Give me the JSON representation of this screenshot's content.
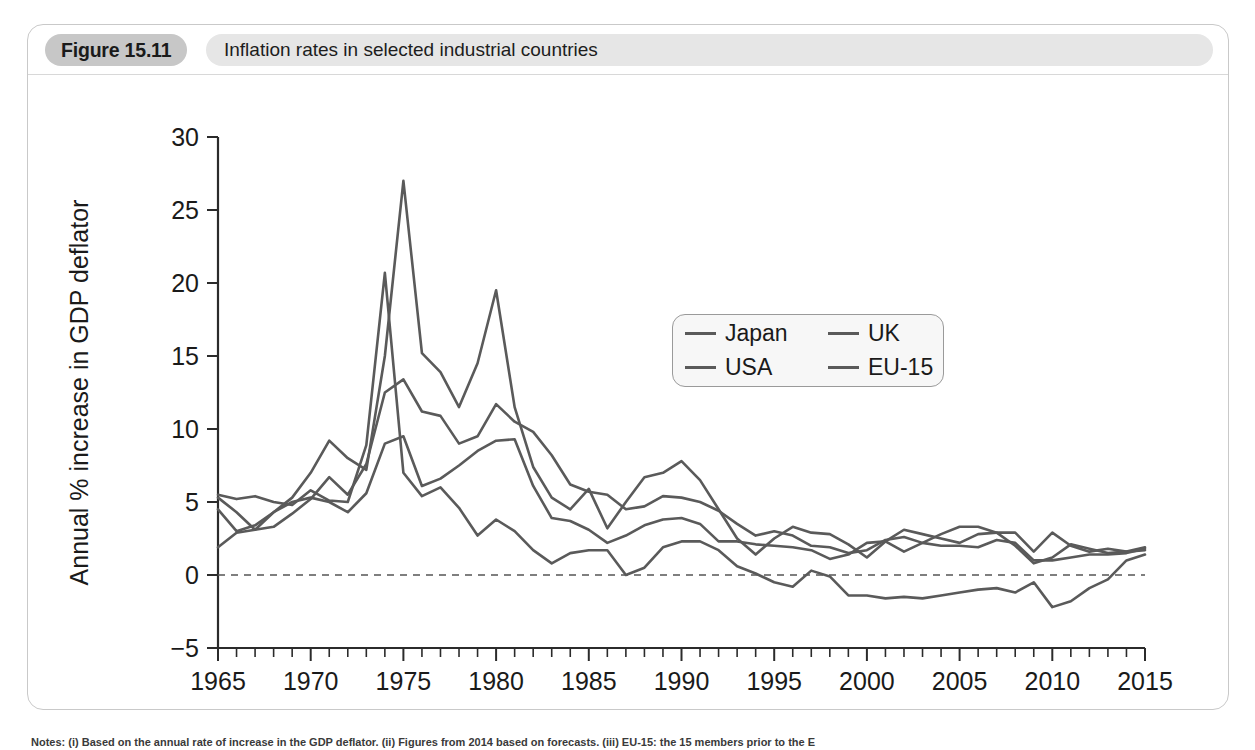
{
  "figure": {
    "number_label": "Figure 15.11",
    "title": "Inflation rates in selected industrial countries",
    "notes": "Notes: (i) Based on the annual rate of increase in the GDP deflator. (ii) Figures from 2014 based on forecasts. (iii) EU-15: the 15 members prior to the E"
  },
  "legend": {
    "items": [
      {
        "label": "Japan",
        "color": "#5a5a5a"
      },
      {
        "label": "UK",
        "color": "#5a5a5a"
      },
      {
        "label": "USA",
        "color": "#5a5a5a"
      },
      {
        "label": "EU-15",
        "color": "#5a5a5a"
      }
    ]
  },
  "chart_data": {
    "type": "line",
    "title": "Inflation rates in selected industrial countries",
    "xlabel": "",
    "ylabel": "Annual % increase in GDP deflator",
    "xlim": [
      1965,
      2015
    ],
    "ylim": [
      -5,
      30
    ],
    "ytick_labels": [
      "30",
      "25",
      "20",
      "15",
      "10",
      "5",
      "0",
      "-5"
    ],
    "yticks": [
      30,
      25,
      20,
      15,
      10,
      5,
      0,
      -5
    ],
    "xtick_labels": [
      "1965",
      "1970",
      "1975",
      "1980",
      "1985",
      "1990",
      "1995",
      "2000",
      "2005",
      "2010",
      "2015"
    ],
    "xticks": [
      1965,
      1970,
      1975,
      1980,
      1985,
      1990,
      1995,
      2000,
      2005,
      2010,
      2015
    ],
    "x_minor_step": 1,
    "grid": false,
    "zero_reference_line": 0,
    "legend_position": "upper-center-right",
    "x": [
      1965,
      1966,
      1967,
      1968,
      1969,
      1970,
      1971,
      1972,
      1973,
      1974,
      1975,
      1976,
      1977,
      1978,
      1979,
      1980,
      1981,
      1982,
      1983,
      1984,
      1985,
      1986,
      1987,
      1988,
      1989,
      1990,
      1991,
      1992,
      1993,
      1994,
      1995,
      1996,
      1997,
      1998,
      1999,
      2000,
      2001,
      2002,
      2003,
      2004,
      2005,
      2006,
      2007,
      2008,
      2009,
      2010,
      2011,
      2012,
      2013,
      2014,
      2015
    ],
    "series": [
      {
        "name": "Japan",
        "color": "#5a5a5a",
        "values": [
          5.5,
          5.2,
          5.4,
          5.0,
          4.8,
          5.8,
          5.1,
          5.0,
          8.9,
          20.7,
          7.0,
          5.4,
          6.0,
          4.6,
          2.7,
          3.8,
          3.0,
          1.7,
          0.8,
          1.5,
          1.7,
          1.7,
          0.0,
          0.5,
          1.9,
          2.3,
          2.3,
          1.7,
          0.6,
          0.1,
          -0.5,
          -0.8,
          0.3,
          -0.1,
          -1.4,
          -1.4,
          -1.6,
          -1.5,
          -1.6,
          -1.4,
          -1.2,
          -1.0,
          -0.9,
          -1.2,
          -0.5,
          -2.2,
          -1.8,
          -0.9,
          -0.3,
          1.0,
          1.4
        ]
      },
      {
        "name": "UK",
        "color": "#5a5a5a",
        "values": [
          4.5,
          3.0,
          3.4,
          4.3,
          5.3,
          7.0,
          9.2,
          8.0,
          7.2,
          15.0,
          27.0,
          15.2,
          13.9,
          11.5,
          14.5,
          19.5,
          11.5,
          7.4,
          5.3,
          4.5,
          5.9,
          3.2,
          5.0,
          6.7,
          7.0,
          7.8,
          6.5,
          4.5,
          2.5,
          1.4,
          2.5,
          3.3,
          2.9,
          2.8,
          2.1,
          1.2,
          2.3,
          3.1,
          2.8,
          2.5,
          2.2,
          2.8,
          2.9,
          2.9,
          1.6,
          2.9,
          2.0,
          1.6,
          1.8,
          1.6,
          1.9
        ]
      },
      {
        "name": "USA",
        "color": "#5a5a5a",
        "values": [
          1.9,
          2.9,
          3.1,
          4.3,
          5.0,
          5.3,
          5.0,
          4.3,
          5.6,
          9.0,
          9.5,
          6.1,
          6.6,
          7.5,
          8.5,
          9.2,
          9.3,
          6.1,
          3.9,
          3.7,
          3.1,
          2.2,
          2.7,
          3.4,
          3.8,
          3.9,
          3.5,
          2.3,
          2.3,
          2.1,
          2.0,
          1.9,
          1.7,
          1.1,
          1.4,
          2.2,
          2.3,
          1.6,
          2.2,
          2.8,
          3.3,
          3.3,
          2.9,
          2.0,
          0.8,
          1.2,
          2.1,
          1.8,
          1.5,
          1.6,
          1.7
        ]
      },
      {
        "name": "EU-15",
        "color": "#5a5a5a",
        "values": [
          5.3,
          4.3,
          3.1,
          3.3,
          4.2,
          5.2,
          6.7,
          5.5,
          7.6,
          12.5,
          13.4,
          11.2,
          10.9,
          9.0,
          9.5,
          11.7,
          10.5,
          9.8,
          8.2,
          6.2,
          5.7,
          5.5,
          4.5,
          4.7,
          5.4,
          5.3,
          5.0,
          4.4,
          3.5,
          2.7,
          3.0,
          2.7,
          2.0,
          1.9,
          1.5,
          1.7,
          2.4,
          2.6,
          2.2,
          2.0,
          2.0,
          1.9,
          2.4,
          2.2,
          1.0,
          1.0,
          1.2,
          1.4,
          1.4,
          1.5,
          1.8
        ]
      }
    ]
  }
}
